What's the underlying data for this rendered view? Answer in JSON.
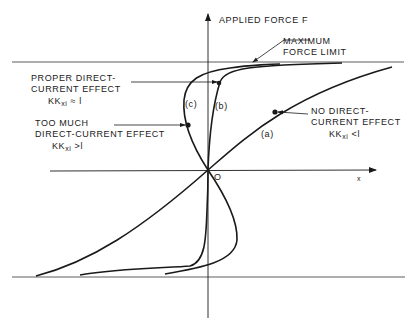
{
  "diagram": {
    "axes": {
      "y_label": "APPLIED FORCE F",
      "x_label": "x",
      "origin_label": "O"
    },
    "annotations": {
      "max_force": [
        "MAXIMUM",
        "FORCE LIMIT"
      ],
      "proper": {
        "lines": [
          "PROPER DIRECT-",
          "CURRENT EFFECT"
        ],
        "cond_main": "KK",
        "cond_sub": "xi",
        "cond_rel": " ≈ l"
      },
      "too_much": {
        "lines": [
          "TOO MUCH",
          "DIRECT-CURRENT EFFECT"
        ],
        "cond_main": "KK",
        "cond_sub": "xi",
        "cond_rel": " >l"
      },
      "none": {
        "lines": [
          "NO DIRECT-",
          "CURRENT EFFECT"
        ],
        "cond_main": "KK",
        "cond_sub": "xi",
        "cond_rel": " <l"
      }
    },
    "curves": [
      {
        "id": "a",
        "label": "(a)"
      },
      {
        "id": "b",
        "label": "(b)"
      },
      {
        "id": "c",
        "label": "(c)"
      }
    ],
    "colors": {
      "ink": "#1a1a1a",
      "background": "#ffffff"
    }
  }
}
